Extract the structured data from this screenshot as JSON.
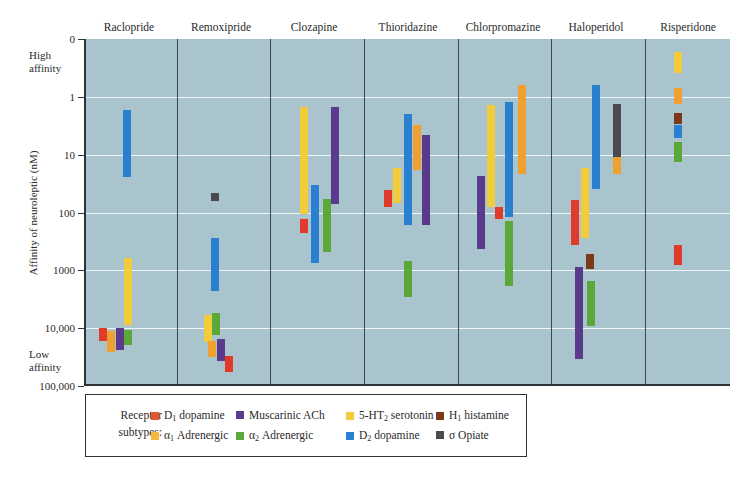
{
  "chart_data": {
    "type": "range-bar",
    "title": "",
    "ylabel": "Affinity of neuroleptic (nM)",
    "yscale": "log",
    "y_inverted": true,
    "y_ticks": [
      "0",
      "1",
      "10",
      "100",
      "1000",
      "10,000",
      "100,000"
    ],
    "y_annotations": {
      "top": "High affinity",
      "bottom": "Low affinity"
    },
    "grid": true,
    "categories": [
      "Raclopride",
      "Remoxipride",
      "Clozapine",
      "Thioridazine",
      "Chlorpromazine",
      "Haloperidol",
      "Risperidone"
    ],
    "receptors": [
      {
        "key": "D1",
        "name": "D1 dopamine",
        "color": "#e03a2a"
      },
      {
        "key": "a1",
        "name": "α1 Adrenergic",
        "color": "#f0a030"
      },
      {
        "key": "mACh",
        "name": "Muscarinic ACh",
        "color": "#5a3a8a"
      },
      {
        "key": "a2",
        "name": "α2 Adrenergic",
        "color": "#5aa83a"
      },
      {
        "key": "5HT2",
        "name": "5-HT2 serotonin",
        "color": "#f2cc3a"
      },
      {
        "key": "D2",
        "name": "D2 dopamine",
        "color": "#2a7fcf"
      },
      {
        "key": "H1",
        "name": "H1 histamine",
        "color": "#7a3a1a"
      },
      {
        "key": "sigma",
        "name": "σ Opiate",
        "color": "#4a4a4e"
      }
    ],
    "series": [
      {
        "drug": "Raclopride",
        "bars": [
          {
            "receptor": "D1",
            "min_nM": 9500,
            "max_nM": 16000,
            "x": 99
          },
          {
            "receptor": "a1",
            "min_nM": 11000,
            "max_nM": 25000,
            "x": 107
          },
          {
            "receptor": "mACh",
            "min_nM": 9500,
            "max_nM": 23000,
            "x": 116
          },
          {
            "receptor": "5HT2",
            "min_nM": 600,
            "max_nM": 8500,
            "x": 124
          },
          {
            "receptor": "a2",
            "min_nM": 10500,
            "max_nM": 19000,
            "x": 124
          },
          {
            "receptor": "D2",
            "min_nM": 1.7,
            "max_nM": 24,
            "x": 123
          }
        ]
      },
      {
        "drug": "Remoxipride",
        "bars": [
          {
            "receptor": "sigma",
            "min_nM": 45,
            "max_nM": 62,
            "x": 211
          },
          {
            "receptor": "D2",
            "min_nM": 270,
            "max_nM": 2200,
            "x": 211
          },
          {
            "receptor": "5HT2",
            "min_nM": 5700,
            "max_nM": 17000,
            "x": 204
          },
          {
            "receptor": "a2",
            "min_nM": 5300,
            "max_nM": 12500,
            "x": 212
          },
          {
            "receptor": "a1",
            "min_nM": 16000,
            "max_nM": 31000,
            "x": 208
          },
          {
            "receptor": "mACh",
            "min_nM": 15000,
            "max_nM": 36000,
            "x": 217
          },
          {
            "receptor": "D1",
            "min_nM": 29000,
            "max_nM": 55000,
            "x": 225
          }
        ]
      },
      {
        "drug": "Clozapine",
        "bars": [
          {
            "receptor": "5HT2",
            "min_nM": 1.5,
            "max_nM": 105,
            "x": 300
          },
          {
            "receptor": "D1",
            "min_nM": 125,
            "max_nM": 220,
            "x": 300
          },
          {
            "receptor": "D2",
            "min_nM": 33,
            "max_nM": 730,
            "x": 311
          },
          {
            "receptor": "a2",
            "min_nM": 58,
            "max_nM": 480,
            "x": 323
          },
          {
            "receptor": "mACh",
            "min_nM": 1.5,
            "max_nM": 70,
            "x": 331
          }
        ]
      },
      {
        "drug": "Thioridazine",
        "bars": [
          {
            "receptor": "D1",
            "min_nM": 40,
            "max_nM": 78,
            "x": 384
          },
          {
            "receptor": "5HT2",
            "min_nM": 17,
            "max_nM": 67,
            "x": 393
          },
          {
            "receptor": "D2",
            "min_nM": 2.0,
            "max_nM": 160,
            "x": 404
          },
          {
            "receptor": "a1",
            "min_nM": 3.1,
            "max_nM": 18,
            "x": 413
          },
          {
            "receptor": "mACh",
            "min_nM": 4.6,
            "max_nM": 160,
            "x": 422
          },
          {
            "receptor": "a2",
            "min_nM": 660,
            "max_nM": 2800,
            "x": 404
          }
        ]
      },
      {
        "drug": "Chlorpromazine",
        "bars": [
          {
            "receptor": "mACh",
            "min_nM": 23,
            "max_nM": 420,
            "x": 477
          },
          {
            "receptor": "5HT2",
            "min_nM": 1.4,
            "max_nM": 80,
            "x": 487
          },
          {
            "receptor": "D1",
            "min_nM": 78,
            "max_nM": 125,
            "x": 495
          },
          {
            "receptor": "D2",
            "min_nM": 1.2,
            "max_nM": 115,
            "x": 505
          },
          {
            "receptor": "a2",
            "min_nM": 135,
            "max_nM": 1800,
            "x": 505
          },
          {
            "receptor": "a1",
            "min_nM": 0.63,
            "max_nM": 21,
            "x": 518
          }
        ]
      },
      {
        "drug": "Haloperidol",
        "bars": [
          {
            "receptor": "D1",
            "min_nM": 59,
            "max_nM": 360,
            "x": 571
          },
          {
            "receptor": "5HT2",
            "min_nM": 17,
            "max_nM": 270,
            "x": 581
          },
          {
            "receptor": "D2",
            "min_nM": 0.63,
            "max_nM": 38,
            "x": 592
          },
          {
            "receptor": "sigma",
            "min_nM": 1.3,
            "max_nM": 11,
            "x": 613
          },
          {
            "receptor": "a1",
            "min_nM": 11,
            "max_nM": 21,
            "x": 613
          },
          {
            "receptor": "H1",
            "min_nM": 500,
            "max_nM": 930,
            "x": 586
          },
          {
            "receptor": "mACh",
            "min_nM": 850,
            "max_nM": 33000,
            "x": 575
          },
          {
            "receptor": "a2",
            "min_nM": 1500,
            "max_nM": 8800,
            "x": 587
          }
        ]
      },
      {
        "drug": "Risperidone",
        "bars": [
          {
            "receptor": "5HT2",
            "min_nM": 0.17,
            "max_nM": 0.39,
            "x": 674
          },
          {
            "receptor": "a1",
            "min_nM": 0.7,
            "max_nM": 1.3,
            "x": 674
          },
          {
            "receptor": "H1",
            "min_nM": 1.9,
            "max_nM": 2.9,
            "x": 674
          },
          {
            "receptor": "D2",
            "min_nM": 3.0,
            "max_nM": 5.1,
            "x": 674
          },
          {
            "receptor": "a2",
            "min_nM": 6.0,
            "max_nM": 13,
            "x": 674
          },
          {
            "receptor": "D1",
            "min_nM": 360,
            "max_nM": 790,
            "x": 674
          }
        ]
      }
    ]
  },
  "axis": {
    "title": "Affinity of neuroleptic (nM)",
    "high_label_1": "High",
    "high_label_2": "affinity",
    "low_label_1": "Low",
    "low_label_2": "affinity",
    "ticks": [
      {
        "label": "0",
        "y": 39
      },
      {
        "label": "1",
        "y": 97
      },
      {
        "label": "10",
        "y": 155
      },
      {
        "label": "100",
        "y": 213
      },
      {
        "label": "1000",
        "y": 270
      },
      {
        "label": "10,000",
        "y": 328
      },
      {
        "label": "100,000",
        "y": 386
      }
    ]
  },
  "drugs": [
    {
      "label": "Raclopride",
      "cx": 129
    },
    {
      "label": "Remoxipride",
      "cx": 221
    },
    {
      "label": "Clozapine",
      "cx": 314
    },
    {
      "label": "Thioridazine",
      "cx": 408
    },
    {
      "label": "Chlorpromazine",
      "cx": 503
    },
    {
      "label": "Haloperidol",
      "cx": 596
    },
    {
      "label": "Risperidone",
      "cx": 688
    }
  ],
  "dividers": [
    175,
    268,
    362,
    456,
    549,
    643
  ],
  "legend": {
    "title_1": "Receptor",
    "title_2": "subtypes:",
    "items": [
      {
        "label_main": "D",
        "label_sub": "1",
        "label_rest": " dopamine",
        "color": "#e05a30",
        "x": 150,
        "y": 14
      },
      {
        "label_main": "Muscarinic ACh",
        "label_sub": "",
        "label_rest": "",
        "color": "#5a3a8a",
        "x": 235,
        "y": 14
      },
      {
        "label_main": "5-HT",
        "label_sub": "2",
        "label_rest": " serotonin",
        "color": "#f2cc3a",
        "x": 260,
        "y": 14
      },
      {
        "label_main": "H",
        "label_sub": "1",
        "label_rest": " histamine",
        "color": "#7a3a1a",
        "x": 356,
        "y": 14
      },
      {
        "label_main": "α",
        "label_sub": "1",
        "label_rest": " Adrenergic",
        "color": "#f5b840",
        "x": 150,
        "y": 34
      },
      {
        "label_main": "α",
        "label_sub": "2",
        "label_rest": " Adrenergic",
        "color": "#5aa83a",
        "x": 235,
        "y": 34
      },
      {
        "label_main": "D",
        "label_sub": "2",
        "label_rest": " dopamine",
        "color": "#2a7fcf",
        "x": 260,
        "y": 34
      },
      {
        "label_main": "σ Opiate",
        "label_sub": "",
        "label_rest": "",
        "color": "#4a4a4e",
        "x": 356,
        "y": 34
      }
    ]
  }
}
